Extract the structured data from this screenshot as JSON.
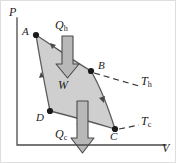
{
  "figure": {
    "background_color": "#ffffff",
    "border_color": "#d9d9d9",
    "width": 176,
    "height": 163
  },
  "axes": {
    "color": "#4a4a4a",
    "y_label": "P",
    "x_label": "V",
    "origin": {
      "x": 17,
      "y": 145
    },
    "y_top": {
      "x": 17,
      "y": 18
    },
    "x_right": {
      "x": 166,
      "y": 145
    }
  },
  "cycle": {
    "fill_color": "#cfcfcf",
    "stroke_color": "#5a5a5a",
    "points": [
      {
        "id": "A",
        "label": "A",
        "x": 36,
        "y": 35,
        "label_x": 23,
        "label_y": 28
      },
      {
        "id": "B",
        "label": "B",
        "x": 91,
        "y": 71,
        "label_x": 98,
        "label_y": 63
      },
      {
        "id": "C",
        "label": "C",
        "x": 115,
        "y": 129,
        "label_x": 110,
        "label_y": 133
      },
      {
        "id": "D",
        "label": "D",
        "x": 50,
        "y": 111,
        "label_x": 37,
        "label_y": 114
      }
    ],
    "direction_arrows": [
      {
        "segment": "A-to-B",
        "x": 56,
        "y": 45
      },
      {
        "segment": "B-to-C",
        "x": 103,
        "y": 101
      },
      {
        "segment": "C-to-D",
        "x": 77,
        "y": 124
      },
      {
        "segment": "D-to-A",
        "x": 41,
        "y": 72
      }
    ]
  },
  "heat_arrows": {
    "fill_color": "#b8b8b8",
    "stroke_color": "#4a4a4a",
    "hot": {
      "label": "Q",
      "subscript": "h",
      "label_x": 57,
      "label_y": 25,
      "shaft_x": 62,
      "shaft_top": 36,
      "shaft_width": 11,
      "head_width": 23,
      "tip_y": 76
    },
    "cold": {
      "label": "Q",
      "subscript": "c",
      "label_x": 62,
      "label_y": 134,
      "shaft_x": 77,
      "shaft_top": 101,
      "shaft_width": 11,
      "head_width": 23,
      "tip_y": 153
    }
  },
  "work": {
    "label": "W",
    "label_x": 62,
    "label_y": 84
  },
  "isotherms": {
    "dash_color": "#3a3a3a",
    "hot": {
      "label": "T",
      "subscript": "h",
      "label_x": 143,
      "label_y": 80,
      "from_x": 93,
      "from_y": 72,
      "to_x": 139,
      "to_y": 86
    },
    "cold": {
      "label": "T",
      "subscript": "c",
      "label_x": 143,
      "label_y": 120,
      "from_x": 118,
      "from_y": 129,
      "to_x": 139,
      "to_y": 126
    }
  }
}
